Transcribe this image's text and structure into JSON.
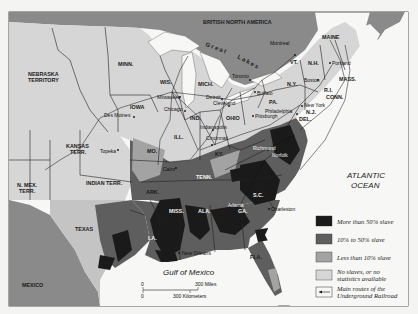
{
  "map": {
    "regions": {
      "british_north_america": "BRITISH NORTH AMERICA",
      "mexico": "MEXICO",
      "great_lakes": "Great Lakes"
    },
    "territories": [
      "NEBRASKA TERRITORY",
      "KANSAS TERR.",
      "INDIAN TERR.",
      "N. MEX. TERR."
    ],
    "states": [
      "MINN.",
      "WIS.",
      "MICH.",
      "IOWA",
      "ILL.",
      "IND.",
      "OHIO",
      "PA.",
      "N.Y.",
      "VT.",
      "N.H.",
      "MAINE",
      "MASS.",
      "R.I.",
      "CONN.",
      "N.J.",
      "DEL.",
      "MD.",
      "VA.",
      "N.C.",
      "S.C.",
      "GA.",
      "FLA.",
      "ALA.",
      "MISS.",
      "LA.",
      "TEXAS",
      "ARK.",
      "MO.",
      "TENN.",
      "KY."
    ],
    "cities": [
      "Montreal",
      "Portland",
      "Boston",
      "New York",
      "Philadelphia",
      "Pittsburgh",
      "Buffalo",
      "Toronto",
      "Detroit",
      "Cleveland",
      "Chicago",
      "Milwaukee",
      "Des Moines",
      "Topeka",
      "Indianapolis",
      "Cincinnati",
      "Cairo",
      "Richmond",
      "Norfolk",
      "Charleston",
      "Atlanta",
      "New Orleans"
    ],
    "water": {
      "atlantic_line1": "ATLANTIC",
      "atlantic_line2": "OCEAN",
      "gulf": "Gulf of Mexico"
    },
    "scale": {
      "zero1": "0",
      "zero2": "0",
      "miles": "300 Miles",
      "km": "300 Kilometers"
    },
    "labels": {
      "nebraska1": "NEBRASKA",
      "nebraska2": "TERRITORY",
      "kansas1": "KANSAS",
      "kansas2": "TERR.",
      "indian": "INDIAN TERR.",
      "nmex1": "N. MEX.",
      "nmex2": "TERR.",
      "minn": "MINN.",
      "wis": "WIS.",
      "mich": "MICH.",
      "iowa": "IOWA",
      "ill": "ILL.",
      "ind": "IND.",
      "ohio": "OHIO",
      "pa": "PA.",
      "ny": "N.Y.",
      "vt": "VT.",
      "nh": "N.H.",
      "maine": "MAINE",
      "mass": "MASS.",
      "ri": "R.I.",
      "conn": "CONN.",
      "nj": "N.J.",
      "del": "DEL.",
      "md": "MD.",
      "va": "VA.",
      "nc": "N.C.",
      "sc": "S.C.",
      "ga": "GA.",
      "fla": "FLA.",
      "ala": "ALA.",
      "miss": "MISS.",
      "la": "LA.",
      "texas": "TEXAS",
      "ark": "ARK.",
      "mo": "MO.",
      "tenn": "TENN.",
      "ky": "KY.",
      "montreal": "Montreal",
      "portland": "Portland",
      "boston": "Boston",
      "newyork": "New York",
      "philadelphia": "Philadelphia",
      "pittsburgh": "Pittsburgh",
      "buffalo": "Buffalo",
      "toronto": "Toronto",
      "detroit": "Detroit",
      "cleveland": "Cleveland",
      "chicago": "Chicago",
      "milwaukee": "Milwaukee",
      "desmoines": "Des Moines",
      "topeka": "Topeka",
      "indianapolis": "Indianapolis",
      "cincinnati": "Cincinnati",
      "cairo": "Cairo",
      "richmond": "Richmond",
      "norfolk": "Norfolk",
      "charleston": "Charleston",
      "atlanta": "Atlanta",
      "neworleans": "New Orleans",
      "bna": "BRITISH NORTH AMERICA",
      "mexico": "MEXICO",
      "great": "Great",
      "lakes": "Lakes"
    }
  },
  "legend": {
    "items": [
      {
        "label": "More than 50% slave",
        "color": "#1a1a1a"
      },
      {
        "label": "10% to 50% slave",
        "color": "#5e5e5e"
      },
      {
        "label": "Less than 10% slave",
        "color": "#a3a3a3"
      },
      {
        "label_line1": "No slaves, or no",
        "label_line2": "statistics available",
        "color": "#d6d6d6"
      },
      {
        "label_line1": "Main routes of the",
        "label_line2": "Underground Railroad",
        "icon": "arrow-left-icon"
      }
    ]
  },
  "colors": {
    "over50": "#1a1a1a",
    "between10_50": "#5e5e5e",
    "under10": "#a3a3a3",
    "none": "#d6d6d6",
    "foreign": "#8a8a8a",
    "water": "#f7f7f5"
  }
}
